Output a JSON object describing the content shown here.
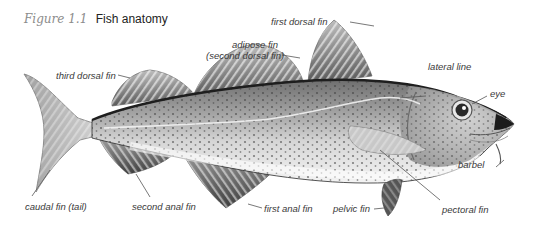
{
  "figure": {
    "number": "Figure 1.1",
    "title": "Fish anatomy"
  },
  "colors": {
    "label_text": "#3a3a3a",
    "figure_number": "#8c8c8c",
    "title_text": "#222222",
    "fish_dark": "#2b2b2b",
    "fish_mid": "#8a8a8a",
    "fish_light": "#d9d9d9",
    "leader_line": "#555555"
  },
  "labels": {
    "first_dorsal_fin": "first dorsal fin",
    "adipose_fin_line1": "adipose fin",
    "adipose_fin_line2": "(second dorsal fin)",
    "third_dorsal_fin": "third dorsal fin",
    "lateral_line": "lateral line",
    "eye": "eye",
    "barbel": "barbel",
    "caudal_fin": "caudal fin (tail)",
    "second_anal_fin": "second anal fin",
    "first_anal_fin": "first anal fin",
    "pelvic_fin": "pelvic fin",
    "pectoral_fin": "pectoral fin"
  }
}
